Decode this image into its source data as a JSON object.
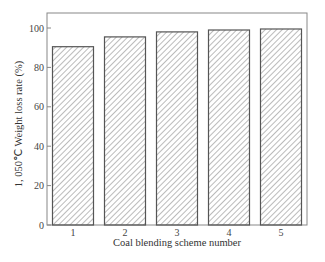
{
  "chart_data": {
    "type": "bar",
    "title": "",
    "xlabel": "Coal blending scheme number",
    "ylabel": "1, 050℃  Weight loss rate (%)",
    "categories": [
      "1",
      "2",
      "3",
      "4",
      "5"
    ],
    "values": [
      90.5,
      95.5,
      98,
      99,
      99.5
    ],
    "ylim": [
      0,
      105
    ],
    "yticks": [
      0,
      20,
      40,
      60,
      80,
      100
    ],
    "grid": false,
    "legend": null,
    "bar_style": "hatched",
    "colors": {
      "bar_edge": "#555555",
      "hatch": "#777777",
      "frame": "#888888"
    }
  }
}
